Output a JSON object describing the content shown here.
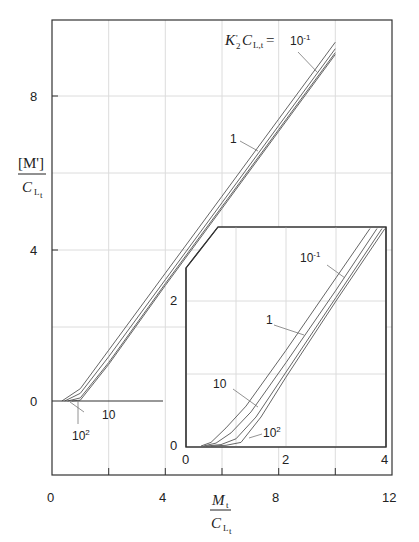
{
  "page": {
    "running_header": "",
    "page_number": ""
  },
  "chart_data": [
    {
      "id": "main",
      "type": "line",
      "title": "",
      "xlabel": "M_t / C_L_t",
      "ylabel": "[M'] / C_L_t",
      "xlim": [
        0,
        12
      ],
      "ylim": [
        -2,
        10
      ],
      "x_ticks": [
        0,
        4,
        8,
        12
      ],
      "y_ticks": [
        0,
        4,
        8
      ],
      "grid": true,
      "legend_title": "K'_2 C_L_t =",
      "series": [
        {
          "name": "10^-1",
          "x": [
            0.35,
            1,
            2,
            4,
            6,
            8,
            10,
            10.8
          ],
          "y": [
            0,
            0.32,
            1.32,
            3.32,
            5.32,
            7.32,
            9.32,
            10.1
          ]
        },
        {
          "name": "1",
          "x": [
            0.45,
            1,
            2,
            4,
            6,
            8,
            10,
            11
          ],
          "y": [
            0,
            0.2,
            1.15,
            3.15,
            5.15,
            7.15,
            9.15,
            10.1
          ]
        },
        {
          "name": "10",
          "x": [
            0.55,
            1,
            2,
            4,
            6,
            8,
            10,
            11
          ],
          "y": [
            0,
            0.08,
            1.0,
            3.05,
            5.05,
            7.05,
            9.05,
            10.05
          ]
        },
        {
          "name": "10^2",
          "x": [
            0.7,
            1,
            2,
            4,
            6,
            8,
            10,
            11
          ],
          "y": [
            0,
            0.02,
            0.95,
            3.0,
            5.0,
            7.0,
            9.0,
            10.0
          ]
        }
      ],
      "annotations": [
        "10^-1",
        "1",
        "10",
        "10^2"
      ]
    },
    {
      "id": "inset",
      "type": "line",
      "xlim": [
        0,
        4
      ],
      "ylim": [
        0,
        3
      ],
      "x_ticks": [
        0,
        2,
        4
      ],
      "y_ticks": [
        0,
        2
      ],
      "grid": true,
      "series": [
        {
          "name": "10^-1",
          "x": [
            0.3,
            0.5,
            0.8,
            1.2,
            2,
            3,
            3.68
          ],
          "y": [
            0,
            0.05,
            0.25,
            0.55,
            1.32,
            2.32,
            3.0
          ]
        },
        {
          "name": "1",
          "x": [
            0.35,
            0.6,
            0.9,
            1.3,
            2,
            3,
            3.82
          ],
          "y": [
            0,
            0.04,
            0.18,
            0.47,
            1.15,
            2.15,
            3.0
          ]
        },
        {
          "name": "10",
          "x": [
            0.4,
            0.7,
            1.0,
            1.4,
            2,
            3,
            3.92
          ],
          "y": [
            0,
            0.02,
            0.1,
            0.4,
            1.02,
            2.05,
            3.0
          ]
        },
        {
          "name": "10^2",
          "x": [
            0.5,
            0.8,
            1.1,
            1.5,
            2,
            3,
            3.98
          ],
          "y": [
            0,
            0.01,
            0.05,
            0.4,
            0.95,
            2.0,
            3.0
          ]
        }
      ],
      "annotations": [
        "10^-1",
        "1",
        "10",
        "10^2"
      ]
    }
  ],
  "labels": {
    "y_tick_0": "0",
    "y_tick_4": "4",
    "y_tick_8": "8",
    "x_tick_0": "0",
    "x_tick_4": "4",
    "x_tick_8": "8",
    "x_tick_12": "12",
    "ylabel_num": "[M']",
    "ylabel_den": "C",
    "ylabel_den_sub": "L",
    "ylabel_den_subsub": "t",
    "xlabel_num": "M",
    "xlabel_num_sub": "t",
    "xlabel_den": "C",
    "xlabel_den_sub": "L",
    "xlabel_den_subsub": "t",
    "legend_K": "K",
    "legend_prime_sub": "'",
    "legend_two": "2",
    "legend_C": "C",
    "legend_C_sub": "L,t",
    "legend_eq": "=",
    "ann_main_01": "10",
    "ann_main_01_exp": "-1",
    "ann_main_1": "1",
    "ann_main_10": "10",
    "ann_main_100": "10",
    "ann_main_100_exp": "2",
    "inset_y_0": "0",
    "inset_y_2": "2",
    "inset_x_0": "0",
    "inset_x_2": "2",
    "inset_x_4": "4",
    "ann_in_01": "10",
    "ann_in_01_exp": "-1",
    "ann_in_1": "1",
    "ann_in_10": "10",
    "ann_in_100": "10",
    "ann_in_100_exp": "2"
  },
  "colors": {
    "axis": "#333333",
    "grid": "#d8d8d8",
    "curve": "#666666"
  }
}
